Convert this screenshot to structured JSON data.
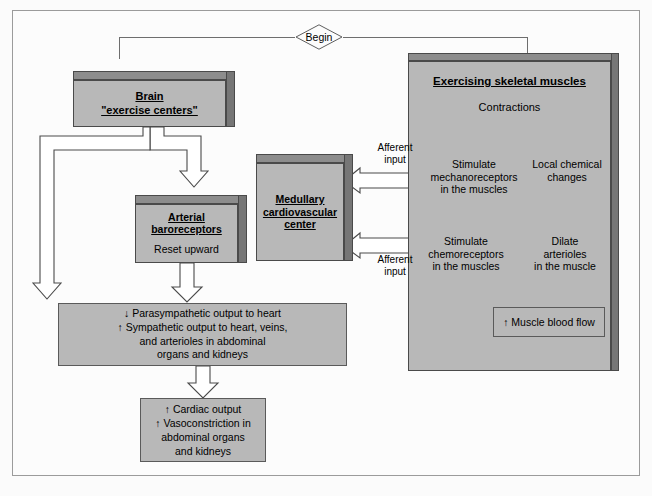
{
  "diagram": {
    "begin_label": "Begin",
    "colors": {
      "box_fill": "#b8b8b8",
      "box_bevel_top": "#8d8d8d",
      "box_bevel_right": "#767676",
      "arrow_fill": "#ffffff",
      "arrow_stroke": "#4a4a4a",
      "line": "#6e6e6e",
      "frame_border": "#9b9b9b",
      "page_bg": "#fcfcfc",
      "text": "#000000"
    }
  },
  "nodes": {
    "brain": {
      "title": "Brain",
      "subtitle": "\"exercise centers\""
    },
    "baroreceptors": {
      "title_line1": "Arterial",
      "title_line2": "baroreceptors",
      "body": "Reset upward"
    },
    "medullary": {
      "line1": "Medullary",
      "line2": "cardiovascular",
      "line3": "center"
    },
    "autonomic_output": {
      "line1": "↓  Parasympathetic output to heart",
      "line2": "↑ Sympathetic output to heart, veins,",
      "line3": "and arterioles in abdominal",
      "line4": "organs and kidneys"
    },
    "cardiac_outcome": {
      "line1": "↑  Cardiac output",
      "line2": "↑  Vasoconstriction in",
      "line3": "abdominal organs",
      "line4": "and kidneys"
    },
    "muscle_panel": {
      "title": "Exercising skeletal muscles",
      "contractions": "Contractions",
      "stimulate_mechano": {
        "line1": "Stimulate",
        "line2": "mechanoreceptors",
        "line3": "in the muscles"
      },
      "local_chemical": {
        "line1": "Local chemical",
        "line2": "changes"
      },
      "stimulate_chemo": {
        "line1": "Stimulate",
        "line2": "chemoreceptors",
        "line3": "in the muscles"
      },
      "dilate_arterioles": {
        "line1": "Dilate",
        "line2": "arterioles",
        "line3": "in the muscle"
      },
      "muscle_blood_flow": "↑ Muscle blood flow"
    }
  },
  "labels": {
    "afferent_input_upper": {
      "line1": "Afferent",
      "line2": "input"
    },
    "afferent_input_lower": {
      "line1": "Afferent",
      "line2": "input"
    }
  }
}
